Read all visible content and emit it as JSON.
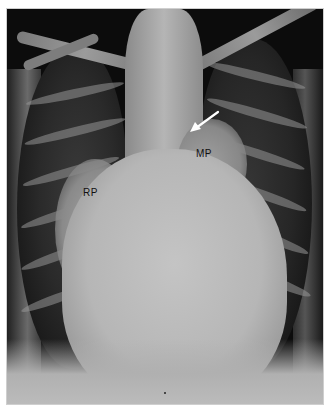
{
  "image": {
    "type": "chest radiograph (PA view)",
    "background": "#ffffff",
    "film_tone": "#0c0c0c"
  },
  "annotations": {
    "rp_label": "RP",
    "mp_label": "MP",
    "arrow": {
      "color": "#ffffff",
      "direction": "pointing down-left toward aortic/pulmonary region"
    }
  }
}
